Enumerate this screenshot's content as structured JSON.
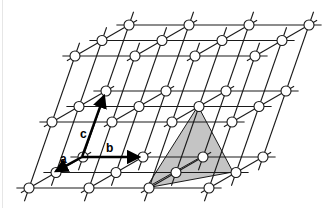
{
  "figure": {
    "lattice": {
      "layers": 3,
      "rows": 3,
      "columns": 4,
      "origin": [
        129,
        25
      ],
      "layer_step": [
        -23,
        66
      ],
      "row_step": [
        -27,
        15.5
      ],
      "col_step": [
        60,
        0
      ]
    },
    "vectors": [
      {
        "name": "a",
        "label": "a",
        "from": [
          82,
          157
        ],
        "to": [
          56,
          171
        ]
      },
      {
        "name": "b",
        "label": "b",
        "from": [
          82,
          157
        ],
        "to": [
          139,
          157
        ]
      },
      {
        "name": "c",
        "label": "c",
        "from": [
          82,
          157
        ],
        "to": [
          104,
          96
        ]
      }
    ],
    "labels": {
      "a": "a",
      "b": "b",
      "c": "c"
    },
    "tetrahedron": {
      "vertices": [
        [
          198,
          106
        ],
        [
          146,
          188
        ],
        [
          233,
          172
        ],
        [
          201,
          157
        ]
      ],
      "fill": "#c4c4c4"
    },
    "colors": {
      "line": "#1a1a1a",
      "node_fill": "#ffffff",
      "arrow": "#000000"
    }
  }
}
